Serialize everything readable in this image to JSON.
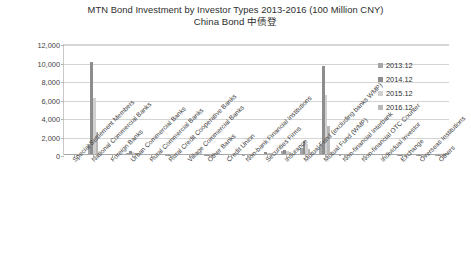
{
  "chart_data": {
    "type": "bar",
    "title": "MTN Bond Investment by Investor Types 2013-2016 (100 Million CNY)",
    "subtitle": "China Bond  中债登",
    "xlabel": "",
    "ylabel": "",
    "ylim": [
      0,
      12000
    ],
    "yticks": [
      "0",
      "2,000",
      "4,000",
      "6,000",
      "8,000",
      "10,000",
      "12,000"
    ],
    "ytick_values": [
      0,
      2000,
      4000,
      6000,
      8000,
      10000,
      12000
    ],
    "grid": true,
    "legend_position": "right",
    "categories": [
      "Special Settlement Members",
      "National Commercial Banks",
      "Foreign Banks",
      "Urban Commercial Banks",
      "Rural Commercial Banks",
      "Rural Credit Cooperative Banks",
      "Village Commercial Banks",
      "Other Banks",
      "Credit Union",
      "Non-bank Financial Institutions",
      "Securities Firms",
      "Insurance",
      "Mutual Fund (excluding banks WMP)",
      "Mutual Fund (WMP)",
      "Non-financial Interbank",
      "Non-financial OTC Counter",
      "Individual Investor",
      "Exchange",
      "Overseas Institutions",
      "Others"
    ],
    "series": [
      {
        "name": "2013.12",
        "color": "#a6a6a6",
        "values": [
          60,
          1200,
          60,
          250,
          60,
          20,
          0,
          10,
          0,
          30,
          140,
          420,
          800,
          1050,
          40,
          0,
          0,
          10,
          20,
          10
        ]
      },
      {
        "name": "2014.12",
        "color": "#8d8d8d",
        "values": [
          90,
          10100,
          80,
          420,
          110,
          30,
          0,
          20,
          0,
          60,
          300,
          520,
          1500,
          9600,
          60,
          0,
          0,
          20,
          30,
          20
        ]
      },
      {
        "name": "2015.12",
        "color": "#d0d0d0",
        "values": [
          70,
          6200,
          60,
          320,
          80,
          20,
          0,
          15,
          0,
          50,
          240,
          430,
          1150,
          6500,
          50,
          0,
          0,
          15,
          25,
          15
        ]
      },
      {
        "name": "2016.12",
        "color": "#b9b9b9",
        "values": [
          50,
          2500,
          50,
          230,
          60,
          15,
          0,
          10,
          0,
          40,
          180,
          360,
          700,
          3100,
          40,
          0,
          0,
          10,
          20,
          10
        ]
      }
    ]
  },
  "legend": {
    "items": [
      {
        "label": "2013.12"
      },
      {
        "label": "2014.12"
      },
      {
        "label": "2015.12"
      },
      {
        "label": "2016.12"
      }
    ]
  }
}
